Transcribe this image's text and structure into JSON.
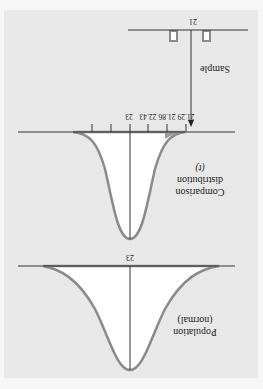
{
  "orientation": "rotated-180",
  "colors": {
    "panel": "#e8e8e8",
    "curve": "#8a8a8a",
    "fill": "#ffffff",
    "shade": "#9a9a9a",
    "line": "#333333"
  },
  "population": {
    "label_line1": "Population",
    "label_line2": "(normal)",
    "mean_label": "23"
  },
  "comparison": {
    "label_line1": "Comparison",
    "label_line2": "distribution",
    "label_line3": "(t)",
    "mean_label": "23",
    "tick_labels": [
      "21.29",
      "21.86",
      "22.43",
      "23"
    ]
  },
  "sample": {
    "label": "Sample",
    "mean_label": "21"
  }
}
